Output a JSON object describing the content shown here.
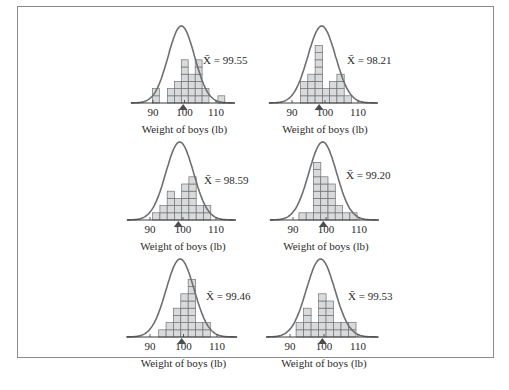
{
  "colors": {
    "bar_fill": "#d9dadb",
    "bar_stroke": "#6f7274",
    "curve": "#6e6f71",
    "marker": "#4b4d50",
    "frame": "#8a8a8a"
  },
  "chart_data": [
    {
      "type": "bar",
      "panel": "top-left",
      "title": "",
      "xlabel": "Weight of boys (lb)",
      "ylabel": "",
      "xticks": [
        90,
        100,
        110
      ],
      "mean_label": "X̄ = 99.55",
      "sample_mean": 99.55,
      "bin_width_lb": 2.2,
      "bins": [
        {
          "x": 89.8,
          "count": 2
        },
        {
          "x": 94.6,
          "count": 2
        },
        {
          "x": 96.8,
          "count": 3
        },
        {
          "x": 99.0,
          "count": 6
        },
        {
          "x": 101.2,
          "count": 4
        },
        {
          "x": 103.4,
          "count": 6
        },
        {
          "x": 105.6,
          "count": 2
        },
        {
          "x": 110.6,
          "count": 1
        }
      ],
      "overlay": "normal curve"
    },
    {
      "type": "bar",
      "panel": "top-right",
      "title": "",
      "xlabel": "Weight of boys (lb)",
      "ylabel": "",
      "xticks": [
        90,
        100,
        110
      ],
      "mean_label": "X̄ = 98.21",
      "sample_mean": 98.21,
      "bin_width_lb": 2.2,
      "bins": [
        {
          "x": 92.6,
          "count": 3
        },
        {
          "x": 94.8,
          "count": 4
        },
        {
          "x": 97.0,
          "count": 8
        },
        {
          "x": 99.2,
          "count": 2
        },
        {
          "x": 101.4,
          "count": 3
        },
        {
          "x": 103.6,
          "count": 4
        },
        {
          "x": 105.8,
          "count": 1
        }
      ],
      "overlay": "normal curve"
    },
    {
      "type": "bar",
      "panel": "middle-left",
      "title": "",
      "xlabel": "Weight of boys (lb)",
      "ylabel": "",
      "xticks": [
        90,
        100,
        110
      ],
      "mean_label": "X̄ = 98.59",
      "sample_mean": 98.59,
      "bin_width_lb": 2.2,
      "bins": [
        {
          "x": 90.8,
          "count": 1
        },
        {
          "x": 93.0,
          "count": 2
        },
        {
          "x": 95.2,
          "count": 4
        },
        {
          "x": 97.4,
          "count": 3
        },
        {
          "x": 99.6,
          "count": 5
        },
        {
          "x": 101.8,
          "count": 6
        },
        {
          "x": 104.0,
          "count": 2
        },
        {
          "x": 106.2,
          "count": 2
        }
      ],
      "overlay": "normal curve"
    },
    {
      "type": "bar",
      "panel": "middle-right",
      "title": "",
      "xlabel": "Weight of boys (lb)",
      "ylabel": "",
      "xticks": [
        90,
        100,
        110
      ],
      "mean_label": "X̄ = 99.20",
      "sample_mean": 99.2,
      "bin_width_lb": 2.2,
      "bins": [
        {
          "x": 91.8,
          "count": 1
        },
        {
          "x": 94.0,
          "count": 1
        },
        {
          "x": 96.2,
          "count": 8
        },
        {
          "x": 98.4,
          "count": 6
        },
        {
          "x": 100.6,
          "count": 5
        },
        {
          "x": 102.8,
          "count": 2
        },
        {
          "x": 105.0,
          "count": 1
        },
        {
          "x": 107.2,
          "count": 1
        }
      ],
      "overlay": "normal curve"
    },
    {
      "type": "bar",
      "panel": "bottom-left",
      "title": "",
      "xlabel": "Weight of boys (lb)",
      "ylabel": "",
      "xticks": [
        90,
        100,
        110
      ],
      "mean_label": "X̄ = 99.46",
      "sample_mean": 99.46,
      "bin_width_lb": 2.2,
      "bins": [
        {
          "x": 92.6,
          "count": 1
        },
        {
          "x": 94.8,
          "count": 2
        },
        {
          "x": 97.0,
          "count": 4
        },
        {
          "x": 99.2,
          "count": 6
        },
        {
          "x": 101.4,
          "count": 8
        },
        {
          "x": 103.6,
          "count": 2
        },
        {
          "x": 105.8,
          "count": 2
        }
      ],
      "overlay": "normal curve"
    },
    {
      "type": "bar",
      "panel": "bottom-right",
      "title": "",
      "xlabel": "Weight of boys (lb)",
      "ylabel": "",
      "xticks": [
        90,
        100,
        110
      ],
      "mean_label": "X̄ = 99.53",
      "sample_mean": 99.53,
      "bin_width_lb": 2.2,
      "bins": [
        {
          "x": 91.8,
          "count": 2
        },
        {
          "x": 94.0,
          "count": 4
        },
        {
          "x": 96.2,
          "count": 2
        },
        {
          "x": 98.4,
          "count": 6
        },
        {
          "x": 100.6,
          "count": 5
        },
        {
          "x": 102.8,
          "count": 2
        },
        {
          "x": 105.0,
          "count": 2
        },
        {
          "x": 107.2,
          "count": 2
        }
      ],
      "overlay": "normal curve"
    }
  ]
}
